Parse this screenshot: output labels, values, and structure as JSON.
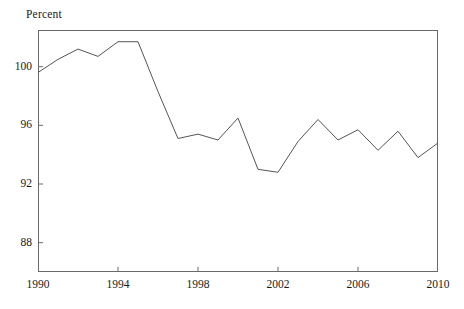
{
  "chart_data": {
    "type": "line",
    "title": "",
    "ylabel": "Percent",
    "xlabel": "",
    "grid": false,
    "legend": "none",
    "line_color": "#555555",
    "axis_color": "#6a6a6a",
    "text_color": "#1a1a1a",
    "xlim": [
      1990,
      2010
    ],
    "ylim": [
      86,
      102.5
    ],
    "yticks": [
      88,
      92,
      96,
      100
    ],
    "ytick_labels": [
      "88",
      "92",
      "96",
      "100"
    ],
    "xticks": [
      1990,
      1994,
      1998,
      2002,
      2006,
      2010
    ],
    "xtick_labels": [
      "1990",
      "1994",
      "1998",
      "2002",
      "2006",
      "2010"
    ],
    "x": [
      1990,
      1991,
      1992,
      1993,
      1994,
      1995,
      1996,
      1997,
      1998,
      1999,
      2000,
      2001,
      2002,
      2003,
      2004,
      2005,
      2006,
      2007,
      2008,
      2009,
      2010
    ],
    "values": [
      99.6,
      100.5,
      101.2,
      100.7,
      101.7,
      101.7,
      98.3,
      95.1,
      95.4,
      95.0,
      96.5,
      93.0,
      92.8,
      94.9,
      96.4,
      95.0,
      95.7,
      94.3,
      95.6,
      93.8,
      94.8
    ],
    "series": [
      {
        "name": "Percent",
        "values": [
          99.6,
          100.5,
          101.2,
          100.7,
          101.7,
          101.7,
          98.3,
          95.1,
          95.4,
          95.0,
          96.5,
          93.0,
          92.8,
          94.9,
          96.4,
          95.0,
          95.7,
          94.3,
          95.6,
          93.8,
          94.8
        ]
      }
    ]
  },
  "axis": {
    "title": "Percent"
  }
}
